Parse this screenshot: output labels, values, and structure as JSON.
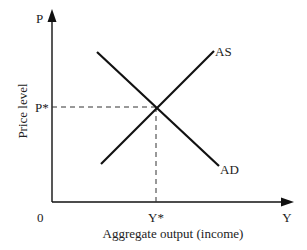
{
  "diagram": {
    "type": "supply-demand",
    "axes": {
      "y_label": "P",
      "y_title": "Price level",
      "x_label": "Y",
      "x_title": "Aggregate output (income)",
      "origin": "0"
    },
    "curves": [
      {
        "name": "AS",
        "label": "AS",
        "from": [
          101,
          164
        ],
        "to": [
          214,
          51
        ]
      },
      {
        "name": "AD",
        "label": "AD",
        "from": [
          97,
          52
        ],
        "to": [
          219,
          166
        ]
      }
    ],
    "equilibrium": {
      "price_label": "P*",
      "output_label": "Y*"
    },
    "colors": {
      "line": "#111111",
      "text": "#222222",
      "background": "#ffffff"
    }
  }
}
